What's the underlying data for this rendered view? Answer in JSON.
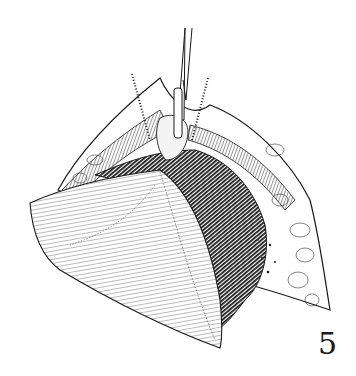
{
  "figure": {
    "number": "5",
    "colors": {
      "background": "#ffffff",
      "ink": "#1a1a1a"
    },
    "elements": [
      "surgical-instrument",
      "dotted-suture-lines",
      "tissue-flap-outline",
      "dark-striated-loops",
      "folded-leaf-flap",
      "fatty-lobules-right"
    ]
  }
}
